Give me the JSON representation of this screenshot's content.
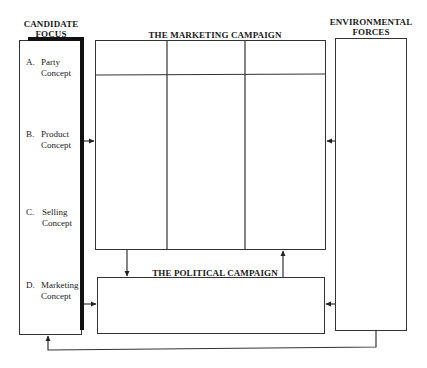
{
  "diagram": {
    "candidate_focus": {
      "title_line1": "CANDIDATE",
      "title_line2": "FOCUS",
      "items": [
        {
          "letter": "A.",
          "line1": "Party",
          "line2": "Concept"
        },
        {
          "letter": "B.",
          "line1": "Product",
          "line2": "Concept"
        },
        {
          "letter": "C.",
          "line1": "Selling",
          "line2": "Concept"
        },
        {
          "letter": "D.",
          "line1": "Marketing",
          "line2": "Concept"
        }
      ]
    },
    "marketing_campaign": {
      "title": "THE MARKETING CAMPAIGN",
      "columns": 3,
      "rows": 2
    },
    "political_campaign": {
      "title": "THE POLITICAL CAMPAIGN"
    },
    "environmental_forces": {
      "title_line1": "ENVIRONMENTAL",
      "title_line2": "FORCES"
    },
    "connections": [
      {
        "from": "candidate_focus",
        "to": "marketing_campaign"
      },
      {
        "from": "environmental_forces",
        "to": "marketing_campaign"
      },
      {
        "from": "marketing_campaign",
        "to": "political_campaign"
      },
      {
        "from": "political_campaign",
        "to": "marketing_campaign"
      },
      {
        "from": "candidate_focus",
        "to": "political_campaign"
      },
      {
        "from": "environmental_forces",
        "to": "political_campaign"
      },
      {
        "from": "environmental_forces",
        "to": "candidate_focus"
      }
    ]
  }
}
